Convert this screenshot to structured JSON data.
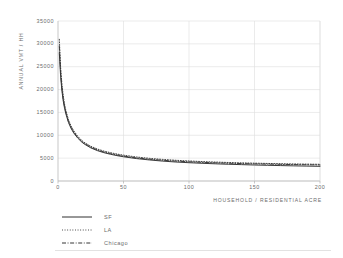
{
  "chart_data": {
    "type": "line",
    "title": "",
    "xlabel": "HOUSEHOLD / RESIDENTIAL ACRE",
    "ylabel": "ANNUAL VMT / HH",
    "xlim": [
      0,
      200
    ],
    "ylim": [
      0,
      35000
    ],
    "xticks": [
      "0",
      "50",
      "100",
      "150",
      "200"
    ],
    "xtick_values": [
      0,
      50,
      100,
      150,
      200
    ],
    "yticks": [
      "0",
      "5000",
      "10000",
      "15000",
      "20000",
      "25000",
      "30000",
      "35000"
    ],
    "ytick_values": [
      0,
      5000,
      10000,
      15000,
      20000,
      25000,
      30000,
      35000
    ],
    "grid": "both",
    "legend_position": "below-left",
    "x": [
      1,
      2,
      3,
      4,
      5,
      6,
      8,
      10,
      12,
      15,
      18,
      20,
      25,
      30,
      35,
      40,
      45,
      50,
      60,
      70,
      80,
      90,
      100,
      110,
      120,
      130,
      140,
      150,
      160,
      170,
      180,
      190,
      200
    ],
    "series": [
      {
        "name": "SF",
        "style": "solid",
        "color": "#303030",
        "values": [
          28000,
          22900,
          19700,
          17500,
          15900,
          14700,
          12800,
          11500,
          10500,
          9400,
          8550,
          8100,
          7250,
          6650,
          6200,
          5850,
          5550,
          5300,
          4900,
          4600,
          4350,
          4150,
          4000,
          3870,
          3760,
          3660,
          3580,
          3500,
          3430,
          3370,
          3310,
          3260,
          3210
        ]
      },
      {
        "name": "LA",
        "style": "dotted",
        "color": "#3a3a3a",
        "values": [
          31000,
          24800,
          21100,
          18600,
          16800,
          15400,
          13400,
          12000,
          11000,
          9800,
          8900,
          8450,
          7600,
          7000,
          6550,
          6200,
          5900,
          5650,
          5250,
          4950,
          4720,
          4530,
          4380,
          4250,
          4140,
          4050,
          3970,
          3900,
          3840,
          3780,
          3730,
          3690,
          3650
        ]
      },
      {
        "name": "Chicago",
        "style": "dashdot",
        "color": "#343434",
        "values": [
          29500,
          23800,
          20300,
          17900,
          16300,
          15000,
          13000,
          11700,
          10700,
          9550,
          8700,
          8250,
          7400,
          6800,
          6350,
          6000,
          5700,
          5450,
          5050,
          4760,
          4530,
          4350,
          4200,
          4080,
          3980,
          3890,
          3810,
          3750,
          3690,
          3640,
          3590,
          3550,
          3510
        ]
      }
    ]
  },
  "legend": {
    "items": [
      {
        "label": "SF"
      },
      {
        "label": "LA"
      },
      {
        "label": "Chicago"
      }
    ]
  },
  "colors": {
    "grid": "#dedede",
    "axis": "#c9c9c9",
    "text": "#6b6b6b",
    "background": "#ffffff"
  }
}
